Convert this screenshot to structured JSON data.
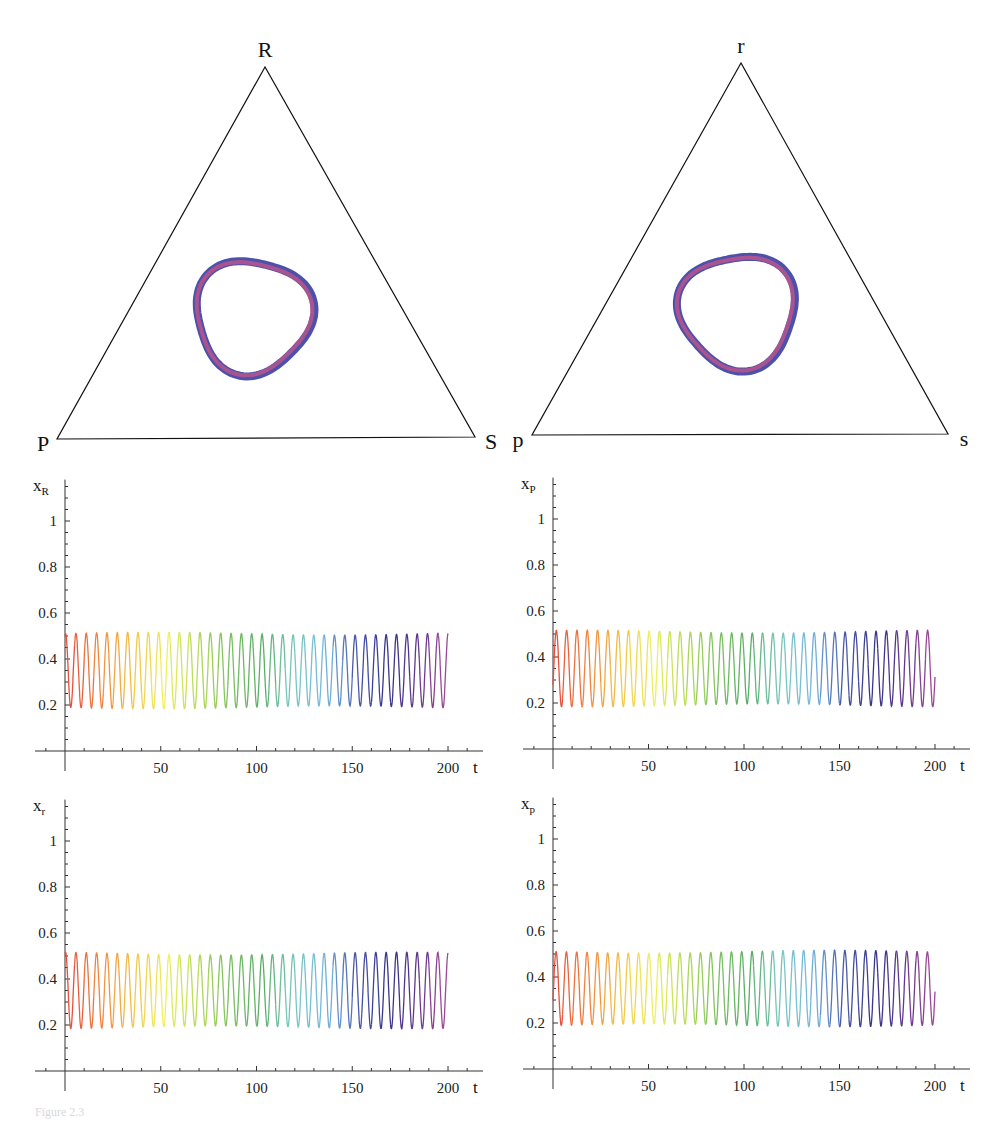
{
  "caption": "Figure 2.3",
  "simplex_plots": [
    {
      "id": "simplex-population-1",
      "vertices": {
        "top": "R",
        "left": "P",
        "right": "S"
      },
      "geometry": {
        "top": [
          265,
          67
        ],
        "left": [
          57,
          439
        ],
        "right": [
          475,
          437
        ]
      },
      "orbit": {
        "center": [
          253,
          316
        ],
        "description": "closed limit cycle around interior fixed point",
        "colors": [
          "#3a3ea0",
          "#c8558a"
        ]
      }
    },
    {
      "id": "simplex-population-2",
      "vertices": {
        "top": "r",
        "left": "p",
        "right": "s"
      },
      "geometry": {
        "top": [
          741,
          63
        ],
        "left": [
          532,
          435
        ],
        "right": [
          948,
          434
        ]
      },
      "orbit": {
        "center": [
          738,
          311
        ],
        "description": "closed limit cycle around interior fixed point",
        "colors": [
          "#3a3ea0",
          "#c8558a"
        ]
      }
    }
  ],
  "chart_data": [
    {
      "type": "line",
      "title": "",
      "ylabel": "x_R",
      "ylabel_main": "x",
      "ylabel_sub": "R",
      "xlabel": "t",
      "xlim": [
        0,
        200
      ],
      "ylim": [
        0,
        1.1
      ],
      "xticks": [
        50,
        100,
        150,
        200
      ],
      "yticks": [
        "0.2",
        "0.4",
        "0.6",
        "0.8",
        "1"
      ],
      "series": [
        {
          "name": "x_R(t)",
          "min": 0.19,
          "max": 0.51,
          "period": 5.4,
          "start_value": 0.5,
          "end_value": 0.5,
          "color_gradient": "rainbow red→yellow→green→cyan→blue→purple over t"
        }
      ],
      "grid": false
    },
    {
      "type": "line",
      "title": "",
      "ylabel": "x_P",
      "ylabel_main": "x",
      "ylabel_sub": "P",
      "xlabel": "t",
      "xlim": [
        0,
        200
      ],
      "ylim": [
        0,
        1.1
      ],
      "xticks": [
        50,
        100,
        150,
        200
      ],
      "yticks": [
        "0.2",
        "0.4",
        "0.6",
        "0.8",
        "1"
      ],
      "series": [
        {
          "name": "x_P(t)",
          "min": 0.19,
          "max": 0.51,
          "period": 5.4,
          "start_value": 0.28,
          "end_value": 0.27,
          "color_gradient": "rainbow red→yellow→green→cyan→blue→purple over t"
        }
      ],
      "grid": false
    },
    {
      "type": "line",
      "title": "",
      "ylabel": "x_r",
      "ylabel_main": "x",
      "ylabel_sub": "r",
      "xlabel": "t",
      "xlim": [
        0,
        200
      ],
      "ylim": [
        0,
        1.1
      ],
      "xticks": [
        50,
        100,
        150,
        200
      ],
      "yticks": [
        "0.2",
        "0.4",
        "0.6",
        "0.8",
        "1"
      ],
      "series": [
        {
          "name": "x_r(t)",
          "min": 0.19,
          "max": 0.51,
          "period": 5.4,
          "start_value": 0.5,
          "end_value": 0.48,
          "color_gradient": "rainbow red→yellow→green→cyan→blue→purple over t"
        }
      ],
      "grid": false
    },
    {
      "type": "line",
      "title": "",
      "ylabel": "x_p",
      "ylabel_main": "x",
      "ylabel_sub": "p",
      "xlabel": "t",
      "xlim": [
        0,
        200
      ],
      "ylim": [
        0,
        1.1
      ],
      "xticks": [
        50,
        100,
        150,
        200
      ],
      "yticks": [
        "0.2",
        "0.4",
        "0.6",
        "0.8",
        "1"
      ],
      "series": [
        {
          "name": "x_p(t)",
          "min": 0.19,
          "max": 0.51,
          "period": 5.4,
          "start_value": 0.3,
          "end_value": 0.3,
          "color_gradient": "rainbow red→yellow→green→cyan→blue→purple over t"
        }
      ],
      "grid": false
    }
  ],
  "panel_layout": [
    {
      "axis_x": 65,
      "axis_y": 751,
      "t200_x": 448,
      "y1_px": 521
    },
    {
      "axis_x": 553,
      "axis_y": 749,
      "t200_x": 935,
      "y1_px": 519
    },
    {
      "axis_x": 65,
      "axis_y": 1071,
      "t200_x": 448,
      "y1_px": 841
    },
    {
      "axis_x": 553,
      "axis_y": 1069,
      "t200_x": 935,
      "y1_px": 839
    }
  ],
  "rainbow_stops": [
    "#e8503c",
    "#f08a40",
    "#f2c64a",
    "#eef060",
    "#b8da58",
    "#7cc060",
    "#5aae68",
    "#7ac8c0",
    "#74b8e0",
    "#4a58a8",
    "#36338a",
    "#6a3a8e",
    "#b0509a"
  ]
}
